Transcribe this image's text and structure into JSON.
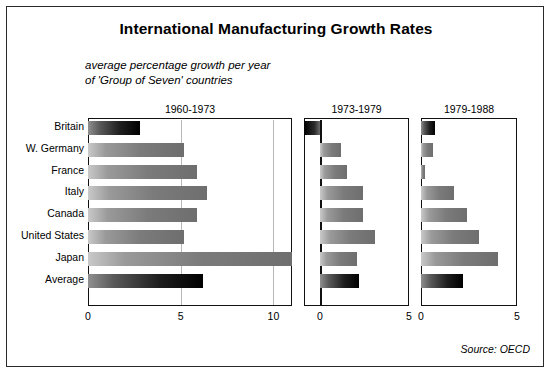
{
  "title": "International Manufacturing Growth Rates",
  "subtitle": "average percentage growth per year\nof 'Group of Seven' countries",
  "source": "Source: OECD",
  "chart_data": {
    "type": "bar",
    "orientation": "horizontal",
    "title": "International Manufacturing Growth Rates",
    "subtitle": "average percentage growth per year of 'Group of Seven' countries",
    "xlabel": "",
    "ylabel": "",
    "grid": true,
    "legend": "none",
    "source": "Source: OECD",
    "categories": [
      "Britain",
      "W. Germany",
      "France",
      "Italy",
      "Canada",
      "United States",
      "Japan",
      "Average"
    ],
    "panels": [
      {
        "name": "1960-1973",
        "label": "1960-1973",
        "xlim": [
          0,
          11
        ],
        "ticks": [
          0,
          5,
          10
        ],
        "tick_labels": [
          "0",
          "5",
          "10"
        ],
        "values": [
          2.8,
          5.2,
          5.9,
          6.4,
          5.9,
          5.2,
          11.0,
          6.2
        ]
      },
      {
        "name": "1973-1979",
        "label": "1973-1979",
        "xlim": [
          -0.9,
          5
        ],
        "ticks": [
          0,
          5
        ],
        "tick_labels": [
          "0",
          "5"
        ],
        "values": [
          -0.9,
          1.2,
          1.5,
          2.4,
          2.4,
          3.1,
          2.1,
          2.2
        ]
      },
      {
        "name": "1979-1988",
        "label": "1979-1988",
        "xlim": [
          0,
          5
        ],
        "ticks": [
          0,
          5
        ],
        "tick_labels": [
          "0",
          "5"
        ],
        "values": [
          0.75,
          0.6,
          0.2,
          1.7,
          2.4,
          3.0,
          4.0,
          2.2
        ]
      }
    ],
    "highlight_rows": [
      "Britain",
      "Average"
    ],
    "colors": {
      "bar_normal_start": "#c9c9c9",
      "bar_normal_end": "#6e6e6e",
      "bar_highlight_start": "#8f8f8f",
      "bar_highlight_end": "#000000",
      "gridline": "#b8b8b8",
      "axis": "#111111",
      "background": "#ffffff"
    }
  }
}
